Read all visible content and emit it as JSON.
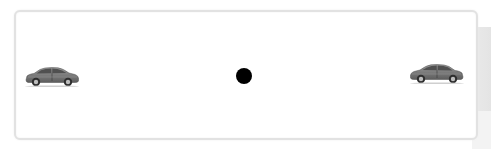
{
  "diagram": {
    "type": "illustration",
    "elements": [
      {
        "id": "car-left",
        "kind": "car",
        "facing": "right",
        "position": "left"
      },
      {
        "id": "center-dot",
        "kind": "dot",
        "color": "#000000",
        "position": "center"
      },
      {
        "id": "car-right",
        "kind": "car",
        "facing": "left",
        "position": "right"
      }
    ],
    "colors": {
      "frame_border": "#e2e2e2",
      "car_body": "#7a7a7a",
      "dot": "#000000",
      "background": "#ffffff"
    }
  }
}
